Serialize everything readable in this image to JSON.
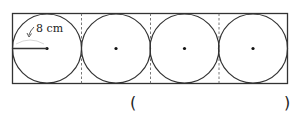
{
  "diagram": {
    "circle_count": 4,
    "radius_label": "8 cm",
    "answer_open": "(",
    "answer_close": ")"
  }
}
